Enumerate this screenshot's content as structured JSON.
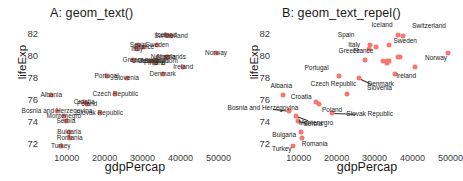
{
  "figure": {
    "width": 463,
    "height": 181,
    "point_color": "#f8766d",
    "text_color": "#1a1a1a",
    "background": "#ffffff"
  },
  "panels": [
    {
      "id": "A",
      "title": "A: geom_text()"
    },
    {
      "id": "B",
      "title": "B: geom_text_repel()"
    }
  ],
  "chart_data": {
    "type": "scatter",
    "subtitle": "",
    "xlabel": "gdpPercap",
    "ylabel": "lifeExp",
    "xlim": [
      3500,
      52500
    ],
    "ylim": [
      71.4,
      82.6
    ],
    "xticks": [
      10000,
      20000,
      30000,
      40000,
      50000
    ],
    "yticks": [
      72,
      74,
      76,
      78,
      80,
      82
    ],
    "grid": false,
    "legend": "none",
    "panel_count": 2,
    "panel_note": "Panel A uses geom_text (overlapping labels); Panel B uses geom_text_repel (labels moved apart with leader segments)",
    "points": [
      {
        "label": "Albania",
        "gdpPercap": 5937,
        "lifeExp": 76.4
      },
      {
        "label": "Austria",
        "gdpPercap": 36126,
        "lifeExp": 79.8
      },
      {
        "label": "Belgium",
        "gdpPercap": 33693,
        "lifeExp": 79.4
      },
      {
        "label": "Bosnia and Herzegovina",
        "gdpPercap": 7446,
        "lifeExp": 74.9
      },
      {
        "label": "Bulgaria",
        "gdpPercap": 10681,
        "lifeExp": 73.0
      },
      {
        "label": "Croatia",
        "gdpPercap": 14619,
        "lifeExp": 75.7
      },
      {
        "label": "Czech Republic",
        "gdpPercap": 22833,
        "lifeExp": 76.5
      },
      {
        "label": "Denmark",
        "gdpPercap": 35278,
        "lifeExp": 78.3
      },
      {
        "label": "Finland",
        "gdpPercap": 33207,
        "lifeExp": 79.3
      },
      {
        "label": "France",
        "gdpPercap": 30470,
        "lifeExp": 80.7
      },
      {
        "label": "Germany",
        "gdpPercap": 32170,
        "lifeExp": 79.4
      },
      {
        "label": "Greece",
        "gdpPercap": 27538,
        "lifeExp": 79.5
      },
      {
        "label": "Iceland",
        "gdpPercap": 36181,
        "lifeExp": 81.8
      },
      {
        "label": "Ireland",
        "gdpPercap": 40676,
        "lifeExp": 78.9
      },
      {
        "label": "Italy",
        "gdpPercap": 28569,
        "lifeExp": 80.5
      },
      {
        "label": "Montenegro",
        "gdpPercap": 9254,
        "lifeExp": 74.5
      },
      {
        "label": "Netherlands",
        "gdpPercap": 36798,
        "lifeExp": 79.8
      },
      {
        "label": "Norway",
        "gdpPercap": 49357,
        "lifeExp": 80.2
      },
      {
        "label": "Poland",
        "gdpPercap": 15390,
        "lifeExp": 75.6
      },
      {
        "label": "Portugal",
        "gdpPercap": 20510,
        "lifeExp": 78.1
      },
      {
        "label": "Romania",
        "gdpPercap": 10808,
        "lifeExp": 72.5
      },
      {
        "label": "Serbia",
        "gdpPercap": 9787,
        "lifeExp": 74.0
      },
      {
        "label": "Slovak Republic",
        "gdpPercap": 18678,
        "lifeExp": 74.7
      },
      {
        "label": "Slovenia",
        "gdpPercap": 25768,
        "lifeExp": 77.9
      },
      {
        "label": "Spain",
        "gdpPercap": 28821,
        "lifeExp": 80.9
      },
      {
        "label": "Sweden",
        "gdpPercap": 33860,
        "lifeExp": 80.9
      },
      {
        "label": "Switzerland",
        "gdpPercap": 37506,
        "lifeExp": 81.7
      },
      {
        "label": "Turkey",
        "gdpPercap": 8458,
        "lifeExp": 71.8
      },
      {
        "label": "United Kingdom",
        "gdpPercap": 33203,
        "lifeExp": 79.4
      }
    ]
  }
}
